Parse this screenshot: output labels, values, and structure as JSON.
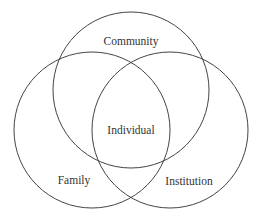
{
  "diagram": {
    "type": "venn",
    "sets": [
      {
        "id": "community",
        "label": "Community",
        "cx": 131,
        "cy": 90,
        "r": 78
      },
      {
        "id": "family",
        "label": "Family",
        "cx": 92,
        "cy": 130,
        "r": 78
      },
      {
        "id": "institution",
        "label": "Institution",
        "cx": 170,
        "cy": 130,
        "r": 78
      }
    ],
    "center_label": "Individual",
    "stroke_color": "#444444"
  }
}
